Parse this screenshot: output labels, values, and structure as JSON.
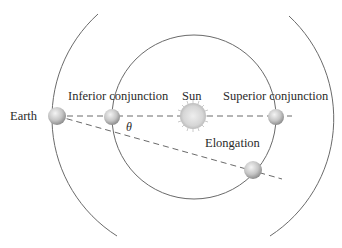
{
  "labels": {
    "earth": "Earth",
    "inferior_conjunction": "Inferior conjunction",
    "sun": "Sun",
    "superior_conjunction": "Superior conjunction",
    "elongation": "Elongation",
    "theta": "θ"
  },
  "colors": {
    "orbit_line": "#6a6a6a",
    "dashed_line": "#6a6a6a",
    "planet_fill": "#c8c8c8",
    "sun_fill": "#d8d8d8",
    "text": "#2a2a2a"
  }
}
